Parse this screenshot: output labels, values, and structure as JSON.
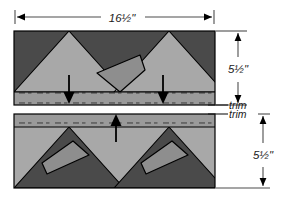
{
  "figure": {
    "colors": {
      "background": "#ffffff",
      "dark_fabric": "#4a4a4a",
      "light_fabric": "#a8a8a8",
      "mid_fabric": "#8e8e8e",
      "seam_strip": "#9a9a9a",
      "outline": "#000000",
      "text": "#1a1a1a",
      "dimension_line": "#4d4d4d"
    },
    "labels": {
      "width": "16½\"",
      "height_top": "5½\"",
      "height_bottom": "5½\"",
      "trim_top": "trim",
      "trim_bottom": "trim"
    },
    "arrows": {
      "top_panel_direction": "down",
      "bottom_panel_direction": "up",
      "width_dimension": "double",
      "height_top_dimension": "double",
      "height_bottom_dimension": "double"
    },
    "panels": [
      {
        "id": "top-panel",
        "name": "Top pieced strip",
        "background_fabric": "dark",
        "triangle_fabric": "light",
        "triangle_count": 2,
        "flap_count": 1,
        "seam_strip_position": "bottom",
        "arrow_count": 2,
        "arrow_direction": "down"
      },
      {
        "id": "bottom-panel",
        "name": "Bottom pieced strip",
        "background_fabric": "light",
        "triangle_fabric": "dark",
        "triangle_count": 2,
        "flap_count": 2,
        "seam_strip_position": "top",
        "arrow_count": 1,
        "arrow_direction": "up"
      }
    ]
  }
}
